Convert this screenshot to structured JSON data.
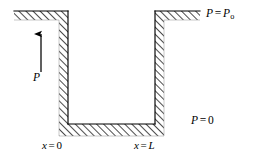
{
  "figure": {
    "background_color": "#ffffff",
    "line_color": "#000000",
    "hatch_color": "#2b2b2b",
    "labels": {
      "pressure_top": {
        "var": "P",
        "equals": "=",
        "value_var": "P",
        "value_sub": "o",
        "full_text": "P = Po"
      },
      "pressure_bottom": {
        "var": "P",
        "equals": "=",
        "value": "0",
        "full_text": "P = 0"
      },
      "x_left": {
        "var": "x",
        "equals": "=",
        "value": "0",
        "full_text": "x = 0"
      },
      "x_right": {
        "var": "x",
        "equals": "=",
        "value": "L",
        "full_text": "x = L"
      },
      "arrow_label": {
        "var": "P",
        "full_text": "P"
      }
    },
    "geometry": {
      "outer_left_x": 14,
      "outer_right_x": 200,
      "top_y": 11,
      "bottom_y": 136,
      "channel_left_inner_x": 68,
      "channel_right_inner_x": 155,
      "channel_floor_y": 124,
      "wall_band_thickness": 9,
      "left_wall_outer_x": 53,
      "right_wall_outer_x": 170
    },
    "arrow": {
      "name": "pressure-direction-arrow",
      "x": 41,
      "y_tail": 72,
      "y_head": 31,
      "direction": "up"
    }
  }
}
